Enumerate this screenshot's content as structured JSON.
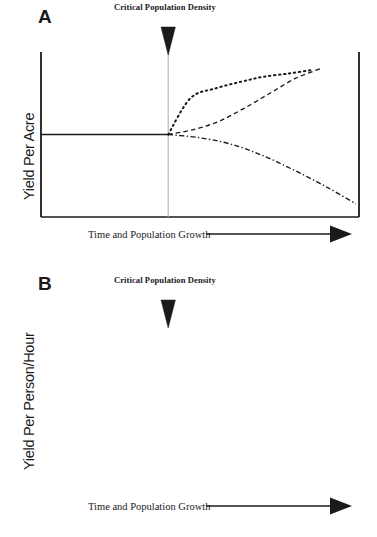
{
  "figure": {
    "title": "",
    "background_color": "#ffffff",
    "ink_color": "#1a1a1a",
    "guide_color": "#b4b4b4"
  },
  "chart_data": {
    "type": "line",
    "title": "",
    "panels": [
      {
        "letter": "A",
        "annotation": "Critical Population Density",
        "ylabel": "Yield Per Acre",
        "xlabel": "Time and Population Growth",
        "grid": false,
        "legend": "none",
        "xlim": [
          0,
          1
        ],
        "ylim": [
          0,
          1
        ],
        "critical_x": 0.4,
        "baseline_y": 0.5,
        "series": [
          {
            "name": "high-input intensification",
            "style": "dotted",
            "x": [
              0.4,
              0.47,
              0.55,
              0.63,
              0.7,
              0.78,
              0.85
            ],
            "y": [
              0.5,
              0.72,
              0.78,
              0.82,
              0.85,
              0.87,
              0.89
            ]
          },
          {
            "name": "moderate intensification",
            "style": "dashed",
            "x": [
              0.4,
              0.48,
              0.56,
              0.64,
              0.72,
              0.8,
              0.88
            ],
            "y": [
              0.5,
              0.53,
              0.58,
              0.66,
              0.75,
              0.84,
              0.9
            ]
          },
          {
            "name": "unsustainable decline",
            "style": "dashdot",
            "x": [
              0.4,
              0.5,
              0.6,
              0.7,
              0.8,
              0.9,
              0.99
            ],
            "y": [
              0.5,
              0.48,
              0.44,
              0.37,
              0.28,
              0.18,
              0.08
            ]
          },
          {
            "name": "pre-threshold baseline",
            "style": "solid",
            "x": [
              0.0,
              0.4
            ],
            "y": [
              0.5,
              0.5
            ]
          }
        ]
      },
      {
        "letter": "B",
        "annotation": "Critical Population Density",
        "ylabel": "Yield Per Person/Hour",
        "xlabel": "Time and Population Growth",
        "grid": false,
        "legend": "none",
        "xlim": [
          0,
          1
        ],
        "ylim": [
          0,
          1
        ],
        "critical_x": 0.4,
        "baseline_y": 0.5,
        "series": [
          {
            "name": "labour-efficient technology",
            "style": "dotted",
            "x": [
              0.4,
              0.48,
              0.58,
              0.68,
              0.78,
              0.88,
              0.99
            ],
            "y": [
              0.5,
              0.94,
              0.95,
              0.96,
              0.965,
              0.97,
              0.975
            ]
          },
          {
            "name": "gradual labour decline",
            "style": "dashdot",
            "x": [
              0.4,
              0.5,
              0.6,
              0.7,
              0.8,
              0.9,
              0.99
            ],
            "y": [
              0.5,
              0.48,
              0.44,
              0.36,
              0.25,
              0.14,
              0.07
            ]
          },
          {
            "name": "rapid labour decline",
            "style": "dashed",
            "x": [
              0.4,
              0.45,
              0.52,
              0.62,
              0.74,
              0.86,
              0.99
            ],
            "y": [
              0.5,
              0.33,
              0.17,
              0.1,
              0.08,
              0.08,
              0.08
            ]
          },
          {
            "name": "pre-threshold baseline",
            "style": "solid",
            "x": [
              0.0,
              0.4
            ],
            "y": [
              0.5,
              0.5
            ]
          }
        ]
      }
    ]
  },
  "panel_a": {
    "letter": "A",
    "cpd_label": "Critical Population Density",
    "ylabel": "Yield Per Acre",
    "xcaption": "Time and Population Growth"
  },
  "panel_b": {
    "letter": "B",
    "cpd_label": "Critical Population Density",
    "ylabel": "Yield Per Person/Hour",
    "xcaption": "Time and Population Growth"
  }
}
